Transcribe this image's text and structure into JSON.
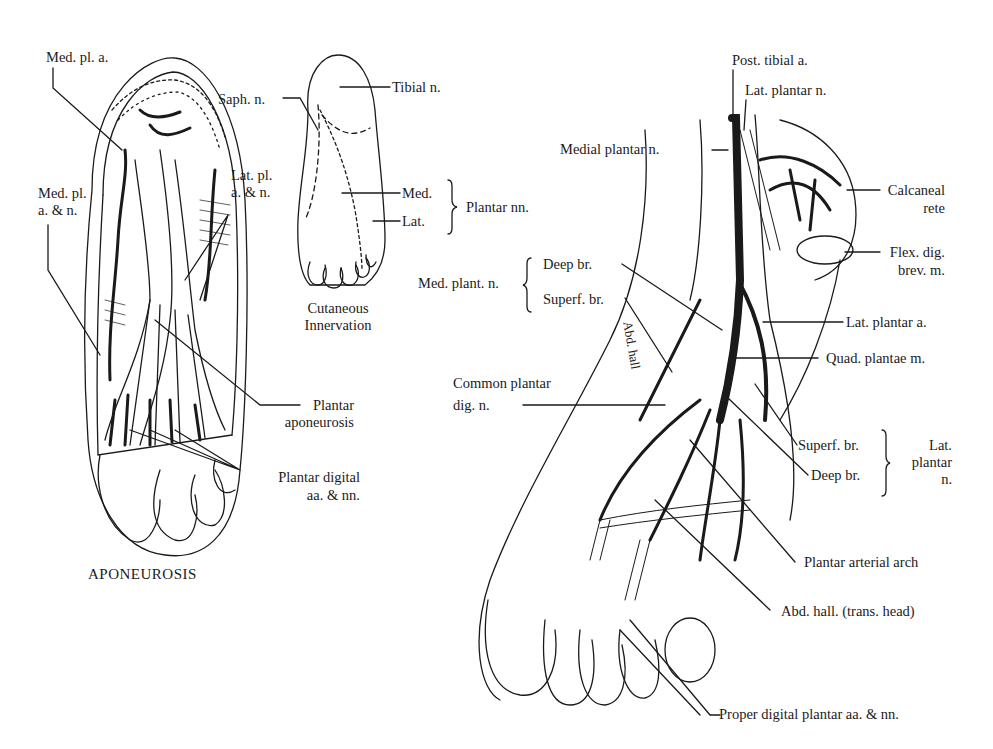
{
  "figure": {
    "panels": [
      {
        "id": "aponeurosis",
        "title": "APONEUROSIS",
        "labels": {
          "med_pl_a": "Med. pl. a.",
          "med_pl_a_n_1": "Med. pl.",
          "med_pl_a_n_2": "a. & n.",
          "lat_pl_a_n_1": "Lat. pl.",
          "lat_pl_a_n_2": "a. & n.",
          "plantar_aponeurosis_1": "Plantar",
          "plantar_aponeurosis_2": "aponeurosis",
          "plantar_digital_1": "Plantar digital",
          "plantar_digital_2": "aa. & nn."
        }
      },
      {
        "id": "cutaneous",
        "title_1": "Cutaneous",
        "title_2": "Innervation",
        "labels": {
          "saph_n": "Saph. n.",
          "tibial_n": "Tibial n.",
          "med": "Med.",
          "lat": "Lat.",
          "plantar_nn": "Plantar nn."
        }
      },
      {
        "id": "deep-dissection",
        "labels": {
          "post_tibial_a": "Post. tibial a.",
          "lat_plantar_n": "Lat. plantar n.",
          "medial_plantar_n": "Medial plantar n.",
          "calcaneal_rete_1": "Calcaneal",
          "calcaneal_rete_2": "rete",
          "flex_dig_1": "Flex. dig.",
          "flex_dig_2": "brev. m.",
          "med_plant_n": "Med. plant. n.",
          "deep_br": "Deep br.",
          "superf_br": "Superf. br.",
          "abd_hall": "Abd. hall",
          "lat_plantar_a": "Lat. plantar a.",
          "quad_plantae": "Quad. plantae m.",
          "common_plantar_1": "Common plantar",
          "common_plantar_2": "dig. n.",
          "lat_superf_br": "Superf. br.",
          "lat_deep_br": "Deep br.",
          "lat_plantar_n_group_1": "Lat.",
          "lat_plantar_n_group_2": "plantar",
          "lat_plantar_n_group_3": "n.",
          "plantar_arterial_arch": "Plantar arterial arch",
          "abd_hall_trans": "Abd. hall. (trans. head)",
          "proper_digital": "Proper digital plantar aa. & nn."
        }
      }
    ],
    "colors": {
      "ink": "#1a1a1a",
      "background": "#ffffff"
    }
  }
}
